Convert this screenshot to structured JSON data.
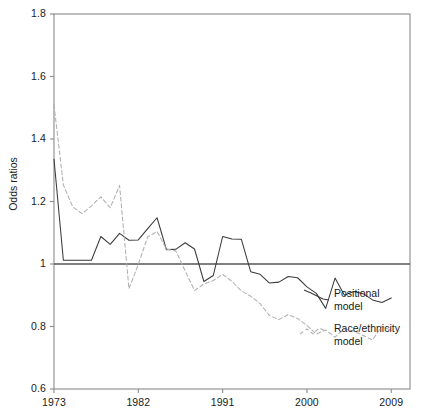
{
  "chart_data": {
    "type": "line",
    "title": "",
    "subtitle": "",
    "xlabel": "",
    "ylabel": "Odds ratios",
    "xlim": [
      1973,
      2011
    ],
    "ylim": [
      0.6,
      1.8
    ],
    "grid": false,
    "legend_position": "right-inside",
    "reference_line": {
      "y": 1,
      "label": "1",
      "color": "#555555"
    },
    "x_ticks": [
      "1973",
      "1982",
      "1991",
      "2000",
      "2009"
    ],
    "x_tick_values": [
      1973,
      1982,
      1991,
      2000,
      2009
    ],
    "y_ticks": [
      "1.8",
      "1.6",
      "1.4",
      "1.2",
      "1",
      "0.8",
      "0.6"
    ],
    "y_tick_values": [
      1.8,
      1.6,
      1.4,
      1.2,
      1.0,
      0.8,
      0.6
    ],
    "x": [
      1973,
      1974,
      1975,
      1976,
      1977,
      1978,
      1979,
      1980,
      1981,
      1982,
      1983,
      1984,
      1985,
      1986,
      1987,
      1988,
      1989,
      1990,
      1991,
      1992,
      1993,
      1994,
      1995,
      1996,
      1997,
      1998,
      1999,
      2000,
      2001,
      2002,
      2003,
      2004,
      2005,
      2006,
      2007,
      2008,
      2009
    ],
    "series": [
      {
        "name": "Positional model",
        "style": "solid",
        "color": "#3a3a3a",
        "values": [
          1.335,
          1.012,
          1.012,
          1.012,
          1.012,
          1.088,
          1.063,
          1.098,
          1.076,
          1.077,
          1.113,
          1.148,
          1.046,
          1.047,
          1.068,
          1.048,
          0.944,
          0.963,
          1.088,
          1.08,
          1.079,
          0.975,
          0.967,
          0.939,
          0.942,
          0.96,
          0.956,
          0.927,
          0.906,
          0.858,
          0.955,
          0.9,
          0.912,
          0.905,
          0.885,
          0.877,
          0.891
        ]
      },
      {
        "name": "Race/ethnicity model",
        "style": "dashed",
        "color": "#b0b0b0",
        "values": [
          1.509,
          1.253,
          1.183,
          1.161,
          1.186,
          1.215,
          1.18,
          1.251,
          0.921,
          0.999,
          1.087,
          1.104,
          1.048,
          1.042,
          0.978,
          0.915,
          0.936,
          0.947,
          0.967,
          0.944,
          0.914,
          0.897,
          0.873,
          0.835,
          0.822,
          0.838,
          0.826,
          0.803,
          0.776,
          0.789,
          0.766,
          0.793,
          0.785,
          0.771,
          0.757,
          0.801,
          0.787
        ]
      }
    ]
  },
  "legend": {
    "entries": [
      {
        "line1": "Positional",
        "line2": "model"
      },
      {
        "line1": "Race/ethnicity",
        "line2": "model"
      }
    ]
  },
  "axis": {
    "y_title": "Odds ratios"
  }
}
